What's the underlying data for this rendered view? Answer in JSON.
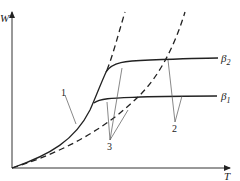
{
  "diagram": {
    "axes": {
      "y_label": "W",
      "x_label": "T"
    },
    "curves": [
      {
        "id": "beta2",
        "label": "β",
        "subscript": "2",
        "style": "solid"
      },
      {
        "id": "beta1",
        "label": "β",
        "subscript": "1",
        "style": "solid"
      },
      {
        "id": "dashed-steep",
        "style": "dashed"
      },
      {
        "id": "dashed-shallow",
        "style": "dashed"
      }
    ],
    "callouts": [
      {
        "label": "1"
      },
      {
        "label": "2"
      },
      {
        "label": "3"
      }
    ]
  }
}
